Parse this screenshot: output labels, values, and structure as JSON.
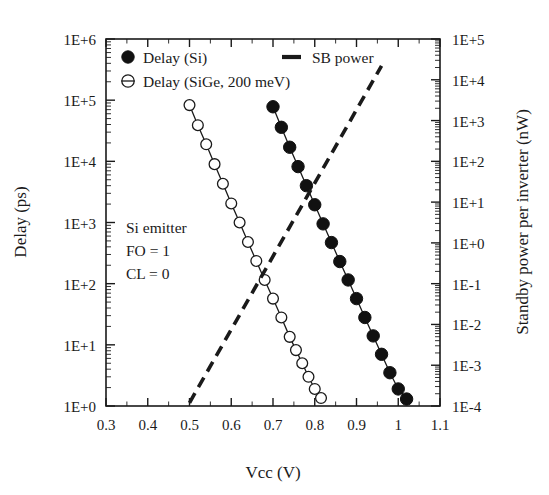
{
  "chart_data": {
    "type": "line",
    "title": "",
    "xlabel": "Vcc (V)",
    "ylabel": "Delay (ps)",
    "y2label": "Standby power per inverter (nW)",
    "xlim": [
      0.3,
      1.1
    ],
    "ylim": [
      1,
      1000000
    ],
    "y2lim": [
      0.0001,
      100000
    ],
    "xscale": "linear",
    "yscale": "log",
    "y2scale": "log",
    "grid": false,
    "legend_position": "top-inside",
    "xticks": [
      "0.3",
      "0.4",
      "0.5",
      "0.6",
      "0.7",
      "0.8",
      "0.9",
      "1",
      "1.1"
    ],
    "xtick_values": [
      0.3,
      0.4,
      0.5,
      0.6,
      0.7,
      0.8,
      0.9,
      1.0,
      1.1
    ],
    "yticks": [
      "1E+0",
      "1E+1",
      "1E+2",
      "1E+3",
      "1E+4",
      "1E+5",
      "1E+6"
    ],
    "ytick_values": [
      1,
      10,
      100,
      1000,
      10000,
      100000,
      1000000
    ],
    "y2ticks": [
      "1E-4",
      "1E-3",
      "1E-2",
      "1E-1",
      "1E+0",
      "1E+1",
      "1E+2",
      "1E+3",
      "1E+4",
      "1E+5"
    ],
    "y2tick_values": [
      0.0001,
      0.001,
      0.01,
      0.1,
      1,
      10,
      100,
      1000,
      10000,
      100000
    ],
    "annotations": [
      "Si emitter",
      "FO = 1",
      "CL = 0"
    ],
    "series": [
      {
        "name": "Delay (Si)",
        "marker": "filled-circle",
        "linestyle": "solid",
        "axis": "left",
        "x": [
          0.7,
          0.72,
          0.74,
          0.76,
          0.78,
          0.8,
          0.82,
          0.84,
          0.86,
          0.88,
          0.9,
          0.92,
          0.94,
          0.96,
          0.98,
          1.0,
          1.02
        ],
        "y": [
          78000,
          36000,
          17000,
          8200,
          4000,
          1950,
          950,
          470,
          230,
          115,
          57,
          28,
          14,
          7.0,
          3.5,
          1.9,
          1.3
        ]
      },
      {
        "name": "Delay (SiGe, 200 meV)",
        "marker": "open-circle",
        "linestyle": "solid",
        "axis": "left",
        "x": [
          0.5,
          0.52,
          0.54,
          0.56,
          0.58,
          0.6,
          0.62,
          0.64,
          0.66,
          0.68,
          0.7,
          0.72,
          0.74,
          0.755,
          0.77,
          0.785,
          0.8,
          0.815
        ],
        "y": [
          83000,
          39000,
          19000,
          9000,
          4300,
          2050,
          1000,
          480,
          235,
          115,
          57,
          28,
          13.5,
          8.2,
          5.0,
          3.0,
          1.9,
          1.35
        ]
      },
      {
        "name": "SB power",
        "marker": "none",
        "linestyle": "dashed",
        "axis": "right",
        "x": [
          0.5,
          0.96
        ],
        "y": [
          0.00012,
          22000
        ]
      }
    ]
  },
  "legend": {
    "entries": [
      {
        "label": "Delay (Si)",
        "marker": "filled-circle"
      },
      {
        "label": "Delay (SiGe, 200 meV)",
        "marker": "open-circle"
      },
      {
        "label": "SB power",
        "marker": "dash"
      }
    ]
  },
  "axes": {
    "x_title": "Vcc (V)",
    "y_left_title": "Delay (ps)",
    "y_right_title": "Standby power per inverter (nW)"
  },
  "annotation_block": {
    "line1": "Si emitter",
    "line2": "FO = 1",
    "line3": "CL = 0"
  },
  "colors": {
    "ink": "#1a1a1a",
    "marker_fill": "#111111",
    "background": "#ffffff"
  }
}
